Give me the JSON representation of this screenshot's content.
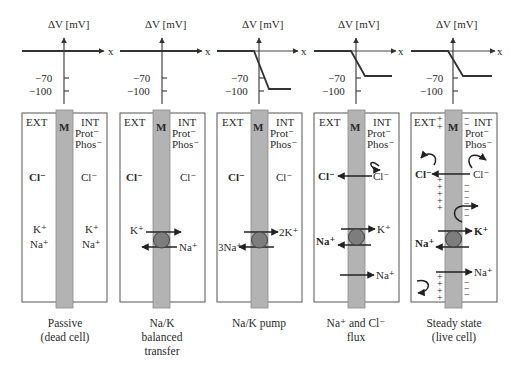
{
  "figure": {
    "axis": {
      "y_label": "ΔV [mV]",
      "x_label": "x",
      "ticks": [
        "−70",
        "−100"
      ]
    },
    "common_labels": {
      "ext": "EXT",
      "int": "INT",
      "membrane": "M",
      "prot": "Prot⁻",
      "phos": "Phos⁻"
    },
    "colors": {
      "membrane": "#b3b3b3",
      "pump": "#7d7d7d",
      "line": "#222222"
    },
    "panels": [
      {
        "id": "passive",
        "caption": [
          "Passive",
          "(dead cell)"
        ],
        "potential_profile": "flat at 0",
        "ions": {
          "ext_cl": "Cl⁻",
          "int_cl": "Cl⁻",
          "ext_k": "K⁺",
          "int_k": "K⁺",
          "ext_na": "Na⁺",
          "int_na": "Na⁺"
        }
      },
      {
        "id": "balanced",
        "caption": [
          "Na/K",
          "balanced",
          "transfer"
        ],
        "potential_profile": "flat at 0",
        "ions": {
          "ext_cl": "Cl⁻",
          "int_cl": "Cl⁻",
          "k_in": "K⁺",
          "na_out": "Na⁺"
        }
      },
      {
        "id": "pump",
        "caption": [
          "Na/K pump"
        ],
        "potential_profile": "0 outside, drops to −100 inside",
        "ions": {
          "ext_cl": "Cl⁻",
          "int_cl": "Cl⁻",
          "k_in": "2K⁺",
          "na_out": "3Na⁺"
        }
      },
      {
        "id": "flux",
        "caption": [
          "Na⁺ and Cl⁻",
          "flux"
        ],
        "potential_profile": "0 outside, drops to −70 inside",
        "ions": {
          "cl_out_left": "Cl⁻",
          "cl_out_right": "Cl⁻",
          "k_in": "K⁺",
          "na_out": "Na⁺",
          "na_leak": "Na⁺"
        }
      },
      {
        "id": "steady",
        "caption": [
          "Steady state",
          "(live cell)"
        ],
        "potential_profile": "0 outside, drops to −70 inside",
        "ions": {
          "cl_out_left": "Cl⁻",
          "cl_out_right": "Cl⁻",
          "k_in": "K⁺",
          "na_out": "Na⁺",
          "na_leak": "Na⁺"
        },
        "charges": {
          "plus": "+",
          "minus": "−"
        }
      }
    ]
  }
}
